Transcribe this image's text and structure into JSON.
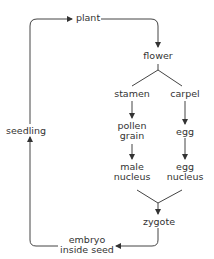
{
  "diagram": {
    "type": "flowchart",
    "title": "",
    "nodes": [
      {
        "id": "plant",
        "label": "plant"
      },
      {
        "id": "flower",
        "label": "flower"
      },
      {
        "id": "stamen",
        "label": "stamen"
      },
      {
        "id": "carpel",
        "label": "carpel"
      },
      {
        "id": "pollen",
        "label": "pollen grain"
      },
      {
        "id": "egg",
        "label": "egg"
      },
      {
        "id": "male_nucleus",
        "label": "male nucleus"
      },
      {
        "id": "egg_nucleus",
        "label": "egg nucleus"
      },
      {
        "id": "zygote",
        "label": "zygote"
      },
      {
        "id": "embryo",
        "label": "embryo inside seed"
      },
      {
        "id": "seedling",
        "label": "seedling"
      }
    ],
    "edges": [
      {
        "from": "plant",
        "to": "flower",
        "arrow": true
      },
      {
        "from": "flower",
        "to": "stamen",
        "arrow": false
      },
      {
        "from": "flower",
        "to": "carpel",
        "arrow": false
      },
      {
        "from": "stamen",
        "to": "pollen",
        "arrow": true
      },
      {
        "from": "carpel",
        "to": "egg",
        "arrow": true
      },
      {
        "from": "pollen",
        "to": "male_nucleus",
        "arrow": true
      },
      {
        "from": "egg",
        "to": "egg_nucleus",
        "arrow": true
      },
      {
        "from": "male_nucleus",
        "to": "zygote",
        "arrow": true
      },
      {
        "from": "egg_nucleus",
        "to": "zygote",
        "arrow": true
      },
      {
        "from": "zygote",
        "to": "embryo",
        "arrow": true
      },
      {
        "from": "embryo",
        "to": "seedling",
        "arrow": true
      },
      {
        "from": "seedling",
        "to": "plant",
        "arrow": true
      }
    ]
  },
  "labels": {
    "plant": "plant",
    "flower": "flower",
    "stamen": "stamen",
    "carpel": "carpel",
    "pollen_1": "pollen",
    "pollen_2": "grain",
    "egg": "egg",
    "male_1": "male",
    "male_2": "nucleus",
    "eggn_1": "egg",
    "eggn_2": "nucleus",
    "zygote": "zygote",
    "embryo_1": "embryo",
    "embryo_2": "inside seed",
    "seedling": "seedling"
  },
  "colors": {
    "line": "#333333",
    "text": "#333333",
    "background": "#ffffff"
  }
}
